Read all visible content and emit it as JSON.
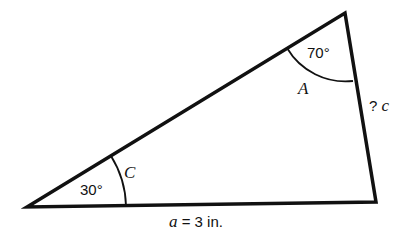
{
  "diagram": {
    "type": "triangle",
    "vertices": {
      "C": {
        "x": 27,
        "y": 207
      },
      "A": {
        "x": 345,
        "y": 13
      },
      "B": {
        "x": 376,
        "y": 202
      }
    },
    "angles": {
      "A": {
        "label": "A",
        "value": "70°"
      },
      "C": {
        "label": "C",
        "value": "30°"
      }
    },
    "sides": {
      "a": {
        "var": "a",
        "text": " = 3 in."
      },
      "c": {
        "prefix": "? ",
        "var": "c"
      }
    },
    "colors": {
      "stroke": "#111111",
      "background": "#ffffff"
    }
  }
}
